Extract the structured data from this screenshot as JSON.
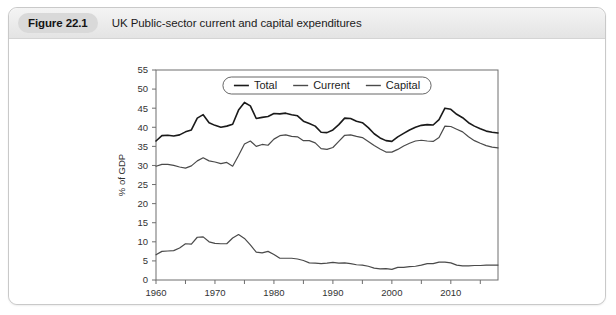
{
  "figure": {
    "badge": "Figure 22.1",
    "caption": "UK Public-sector current and capital expenditures"
  },
  "chart_data": {
    "type": "line",
    "title": "UK Public-sector current and capital expenditures",
    "xlabel": "",
    "ylabel": "% of GDP",
    "xlim": [
      1960,
      2018
    ],
    "ylim": [
      0,
      55
    ],
    "ytick_step": 5,
    "yticks": [
      0,
      5,
      10,
      15,
      20,
      25,
      30,
      35,
      40,
      45,
      50,
      55
    ],
    "xticks_major": [
      1960,
      1970,
      1980,
      1990,
      2000,
      2010
    ],
    "xticks_minor": [
      1965,
      1975,
      1985,
      1995,
      2005,
      2015
    ],
    "grid": false,
    "legend_position": "top-center",
    "legend": [
      "Total",
      "Current",
      "Capital"
    ],
    "x": [
      1960,
      1961,
      1962,
      1963,
      1964,
      1965,
      1966,
      1967,
      1968,
      1969,
      1970,
      1971,
      1972,
      1973,
      1974,
      1975,
      1976,
      1977,
      1978,
      1979,
      1980,
      1981,
      1982,
      1983,
      1984,
      1985,
      1986,
      1987,
      1988,
      1989,
      1990,
      1991,
      1992,
      1993,
      1994,
      1995,
      1996,
      1997,
      1998,
      1999,
      2000,
      2001,
      2002,
      2003,
      2004,
      2005,
      2006,
      2007,
      2008,
      2009,
      2010,
      2011,
      2012,
      2013,
      2014,
      2015,
      2016,
      2017,
      2018
    ],
    "series": [
      {
        "name": "Total",
        "color": "#1a1a1a",
        "width": 1.6,
        "values": [
          36.4,
          37.8,
          37.9,
          37.7,
          38.0,
          38.8,
          39.3,
          42.4,
          43.3,
          41.2,
          40.5,
          40.0,
          40.3,
          40.8,
          44.5,
          46.5,
          45.6,
          42.3,
          42.6,
          42.8,
          43.6,
          43.5,
          43.7,
          43.3,
          43.0,
          41.6,
          41.0,
          40.3,
          38.7,
          38.6,
          39.3,
          40.7,
          42.4,
          42.3,
          41.6,
          41.2,
          39.9,
          38.3,
          37.2,
          36.5,
          36.3,
          37.5,
          38.4,
          39.3,
          40.0,
          40.5,
          40.7,
          40.6,
          42.0,
          45.0,
          44.7,
          43.4,
          42.5,
          41.2,
          40.3,
          39.6,
          39.0,
          38.7,
          38.5
        ]
      },
      {
        "name": "Current",
        "color": "#4a4a4a",
        "width": 1.2,
        "values": [
          29.8,
          30.3,
          30.3,
          30.0,
          29.6,
          29.3,
          29.9,
          31.2,
          32.0,
          31.2,
          30.9,
          30.5,
          30.8,
          29.8,
          32.6,
          35.6,
          36.4,
          35.0,
          35.5,
          35.3,
          36.9,
          37.8,
          38.0,
          37.6,
          37.5,
          36.5,
          36.5,
          35.9,
          34.4,
          34.2,
          34.7,
          36.3,
          37.9,
          38.0,
          37.6,
          37.3,
          36.3,
          35.2,
          34.3,
          33.5,
          33.5,
          34.2,
          35.1,
          35.8,
          36.4,
          36.6,
          36.4,
          36.3,
          37.3,
          40.3,
          40.2,
          39.5,
          38.8,
          37.5,
          36.5,
          35.8,
          35.2,
          34.8,
          34.6
        ]
      },
      {
        "name": "Capital",
        "color": "#4a4a4a",
        "width": 1.2,
        "values": [
          6.6,
          7.5,
          7.6,
          7.7,
          8.4,
          9.5,
          9.4,
          11.2,
          11.3,
          10.0,
          9.6,
          9.5,
          9.5,
          11.0,
          11.9,
          10.9,
          9.2,
          7.3,
          7.1,
          7.5,
          6.7,
          5.7,
          5.7,
          5.7,
          5.5,
          5.1,
          4.5,
          4.4,
          4.3,
          4.4,
          4.6,
          4.4,
          4.5,
          4.3,
          4.0,
          3.9,
          3.6,
          3.1,
          2.9,
          3.0,
          2.8,
          3.3,
          3.3,
          3.5,
          3.6,
          3.9,
          4.3,
          4.3,
          4.7,
          4.7,
          4.5,
          3.9,
          3.7,
          3.7,
          3.8,
          3.8,
          3.9,
          3.9,
          3.9
        ]
      }
    ]
  }
}
